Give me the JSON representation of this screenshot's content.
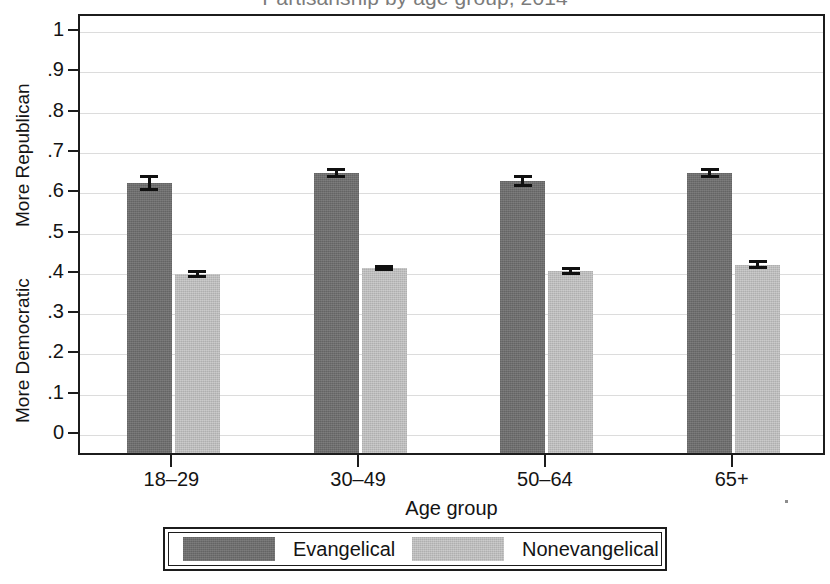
{
  "chart_data": {
    "type": "bar",
    "title": "Partisanship by age group, 2014",
    "xlabel": "Age group",
    "ylabel": "",
    "ylim": [
      0,
      1
    ],
    "grid": true,
    "legend_position": "bottom",
    "categories": [
      "18–29",
      "30–49",
      "50–64",
      "65+"
    ],
    "ytick_labels": [
      "0",
      ".1",
      ".2",
      ".3",
      ".4",
      ".5",
      ".6",
      ".7",
      ".8",
      ".9",
      "1"
    ],
    "ytick_values": [
      0,
      0.1,
      0.2,
      0.3,
      0.4,
      0.5,
      0.6,
      0.7,
      0.8,
      0.9,
      1
    ],
    "axis_annotations": {
      "top": "More Republican",
      "bottom": "More Democratic"
    },
    "series": [
      {
        "name": "Evangelical",
        "color": "#6e6e6e",
        "values": [
          0.625,
          0.65,
          0.63,
          0.65
        ],
        "errors": [
          0.02,
          0.012,
          0.014,
          0.013
        ]
      },
      {
        "name": "Nonevangelical",
        "color": "#bcbcbc",
        "values": [
          0.4,
          0.415,
          0.408,
          0.423
        ],
        "errors": [
          0.01,
          0.008,
          0.01,
          0.012
        ]
      }
    ]
  },
  "legend": {
    "items": [
      {
        "label": "Evangelical",
        "color": "#6e6e6e"
      },
      {
        "label": "Nonevangelical",
        "color": "#bcbcbc"
      }
    ]
  }
}
